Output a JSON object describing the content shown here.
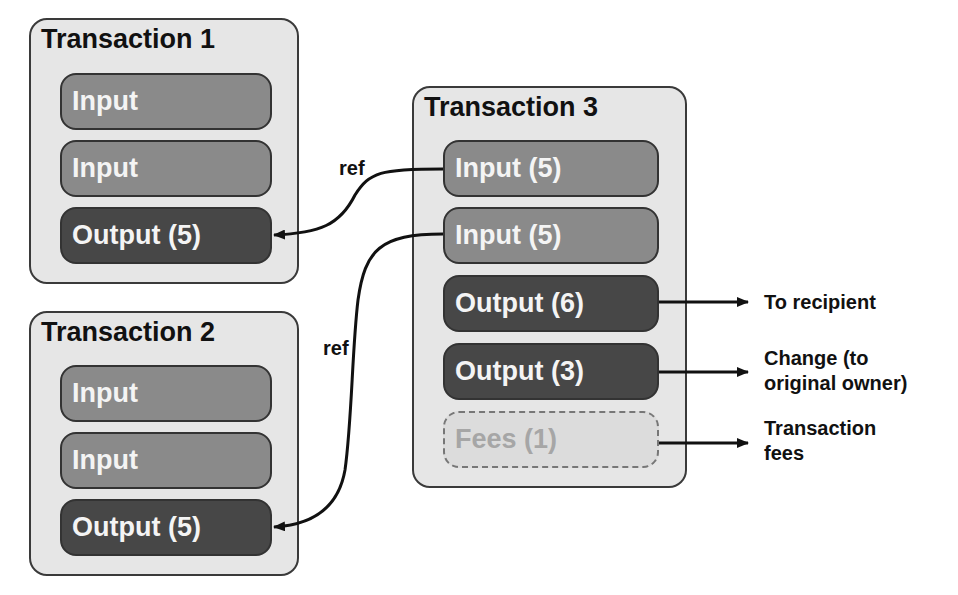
{
  "transactions": [
    {
      "title": "Transaction 1",
      "items": [
        {
          "label": "Input",
          "kind": "input"
        },
        {
          "label": "Input",
          "kind": "input"
        },
        {
          "label": "Output (5)",
          "kind": "output"
        }
      ]
    },
    {
      "title": "Transaction 2",
      "items": [
        {
          "label": "Input",
          "kind": "input"
        },
        {
          "label": "Input",
          "kind": "input"
        },
        {
          "label": "Output (5)",
          "kind": "output"
        }
      ]
    },
    {
      "title": "Transaction 3",
      "items": [
        {
          "label": "Input (5)",
          "kind": "input"
        },
        {
          "label": "Input (5)",
          "kind": "input"
        },
        {
          "label": "Output (6)",
          "kind": "output"
        },
        {
          "label": "Output (3)",
          "kind": "output"
        },
        {
          "label": "Fees (1)",
          "kind": "fee"
        }
      ]
    }
  ],
  "refs": [
    {
      "label": "ref",
      "from": "Transaction 3 Input (5) #1",
      "to": "Transaction 1 Output (5)"
    },
    {
      "label": "ref",
      "from": "Transaction 3 Input (5) #2",
      "to": "Transaction 2 Output (5)"
    }
  ],
  "destinations": [
    {
      "label": "To recipient"
    },
    {
      "label": "Change (to original owner)",
      "line1": "Change (to",
      "line2": "original owner)"
    },
    {
      "label": "Transaction fees",
      "line1": "Transaction",
      "line2": "fees"
    }
  ],
  "colors": {
    "tx_background": "#e6e6e6",
    "input_fill": "#8a8a8a",
    "output_fill": "#474747",
    "fee_fill": "#dcdcdc"
  }
}
